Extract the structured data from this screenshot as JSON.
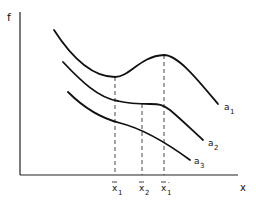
{
  "diagram": {
    "y_axis_label": "f",
    "x_axis_label": "x",
    "curves": [
      {
        "name": "a",
        "subscript": "1"
      },
      {
        "name": "a",
        "subscript": "2"
      },
      {
        "name": "a",
        "subscript": "3"
      }
    ],
    "markers": [
      {
        "name": "x",
        "subscript": "1",
        "prime": "",
        "bar": true
      },
      {
        "name": "x",
        "subscript": "2",
        "prime": "",
        "bar": true
      },
      {
        "name": "x",
        "subscript": "1",
        "prime": "′",
        "bar": true
      }
    ]
  }
}
